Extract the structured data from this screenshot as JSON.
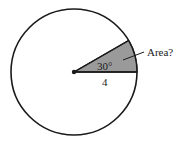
{
  "diagram": {
    "type": "circle-sector",
    "circle": {
      "cx": 74,
      "cy": 72,
      "r": 63,
      "stroke": "#1a1a1a",
      "fill": "#ffffff"
    },
    "sector": {
      "angle_deg": 30,
      "fill": "#9a9a9a"
    },
    "labels": {
      "angle": "30°",
      "radius": "4",
      "callout": "Area?"
    },
    "colors": {
      "stroke": "#1a1a1a",
      "sector_fill": "#9a9a9a",
      "background": "#ffffff"
    }
  }
}
